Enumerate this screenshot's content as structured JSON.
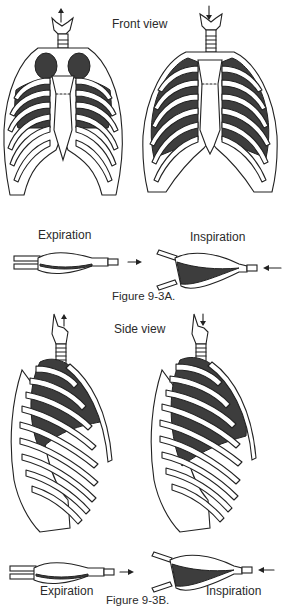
{
  "figure_a": {
    "view_label": "Front view",
    "caption": "Figure 9-3A.",
    "left": {
      "state": "Expiration",
      "trachea_arrow": "up-arrow"
    },
    "right": {
      "state": "Inspiration",
      "trachea_arrow": "down-arrow"
    },
    "bellows_left_label": "Expiration",
    "bellows_right_label": "Inspiration"
  },
  "figure_b": {
    "view_label": "Side view",
    "caption": "Figure 9-3B.",
    "left": {
      "state": "Expiration",
      "trachea_arrow": "up-arrow"
    },
    "right": {
      "state": "Inspiration",
      "trachea_arrow": "down-arrow"
    },
    "bellows_left_label": "Expiration",
    "bellows_right_label": "Inspiration"
  },
  "colors": {
    "lung_fill": "#3d3d3d",
    "line": "#222222",
    "background": "#ffffff"
  }
}
